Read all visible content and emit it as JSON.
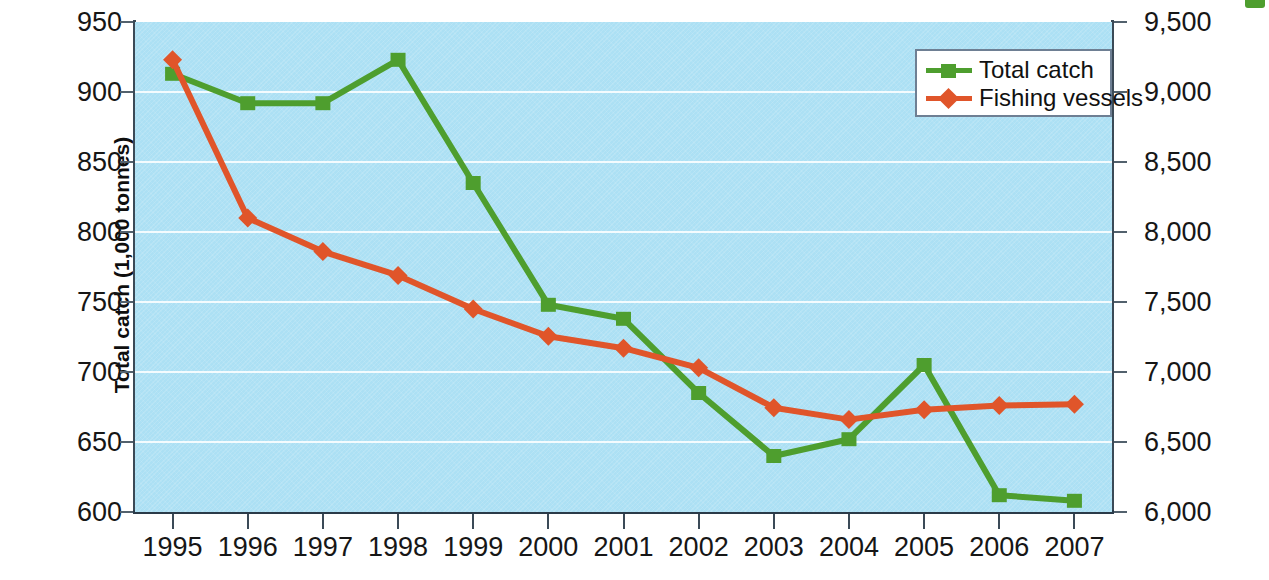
{
  "chart_data": {
    "type": "line",
    "title": "",
    "subtitle": "",
    "xlabel": "",
    "ylabel": "Total catch (1,000 tonnes)",
    "ylabel_right": "Number of fishing  vessels",
    "categories": [
      "1995",
      "1996",
      "1997",
      "1998",
      "1999",
      "2000",
      "2001",
      "2002",
      "2003",
      "2004",
      "2005",
      "2006",
      "2007"
    ],
    "grid": true,
    "legend_position": "top-right",
    "ylim": [
      600,
      950
    ],
    "yticks": [
      950,
      900,
      850,
      800,
      750,
      700,
      650,
      600
    ],
    "ytick_labels": [
      "950",
      "900",
      "850",
      "800",
      "750",
      "700",
      "650",
      "600"
    ],
    "ylim_right": [
      6000,
      9500
    ],
    "yticks_right": [
      9500,
      9000,
      8500,
      8000,
      7500,
      7000,
      6500,
      6000
    ],
    "ytick_labels_right": [
      "9,500",
      "9,000",
      "8,500",
      "8,000",
      "7,500",
      "7,000",
      "6,500",
      "6,000"
    ],
    "series": [
      {
        "name": "Total catch",
        "axis": "left",
        "color": "#4e9e2e",
        "marker": "square",
        "values": [
          913,
          892,
          892,
          923,
          835,
          748,
          738,
          685,
          640,
          652,
          705,
          612,
          608
        ]
      },
      {
        "name": "Fishing vessels",
        "axis": "right",
        "color": "#e0552a",
        "marker": "diamond",
        "values": [
          9230,
          8100,
          7860,
          7690,
          7450,
          7255,
          7170,
          7030,
          6745,
          6660,
          6730,
          6760,
          6770
        ]
      }
    ]
  },
  "legend": {
    "items": [
      {
        "label": "Total catch",
        "color": "#4e9e2e",
        "marker": "square"
      },
      {
        "label": "Fishing vessels",
        "color": "#e0552a",
        "marker": "diamond"
      }
    ]
  },
  "colors": {
    "plot_background": "#ace0f4",
    "gridline": "#ffffff",
    "axis": "#3b4a57",
    "total_catch": "#4e9e2e",
    "fishing_vessels": "#e0552a",
    "legend_border": "#6e7f93",
    "text": "#161616"
  }
}
